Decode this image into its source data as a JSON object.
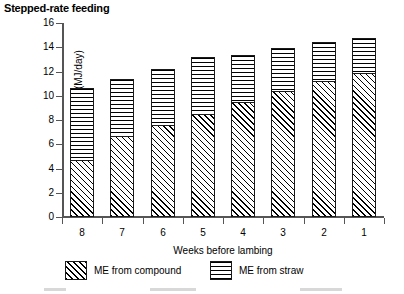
{
  "chart_data": {
    "type": "bar",
    "stacked": true,
    "title": "Stepped-rate feeding",
    "xlabel": "Weeks before lambing",
    "ylabel": "ME (MJ/day)",
    "categories": [
      "8",
      "7",
      "6",
      "5",
      "4",
      "3",
      "2",
      "1"
    ],
    "ylim": [
      0,
      16
    ],
    "yticks": [
      0,
      2,
      4,
      6,
      8,
      10,
      12,
      14,
      16
    ],
    "grid": false,
    "legend_position": "bottom",
    "series": [
      {
        "name": "ME from compound",
        "fill": "diagonal-hatch",
        "values": [
          4.7,
          6.7,
          7.6,
          8.5,
          9.5,
          10.4,
          11.2,
          11.9
        ]
      },
      {
        "name": "ME from straw",
        "fill": "horizontal-hatch",
        "values": [
          5.9,
          4.7,
          4.6,
          4.7,
          3.9,
          3.5,
          3.2,
          2.9
        ]
      }
    ],
    "totals": [
      10.6,
      11.4,
      12.2,
      13.2,
      13.4,
      13.9,
      14.4,
      14.8
    ]
  },
  "legend": {
    "entries": [
      {
        "label": "ME from compound"
      },
      {
        "label": "ME from straw"
      }
    ]
  },
  "colors": {
    "ink": "#000000",
    "axis": "#555555",
    "background": "#ffffff"
  }
}
